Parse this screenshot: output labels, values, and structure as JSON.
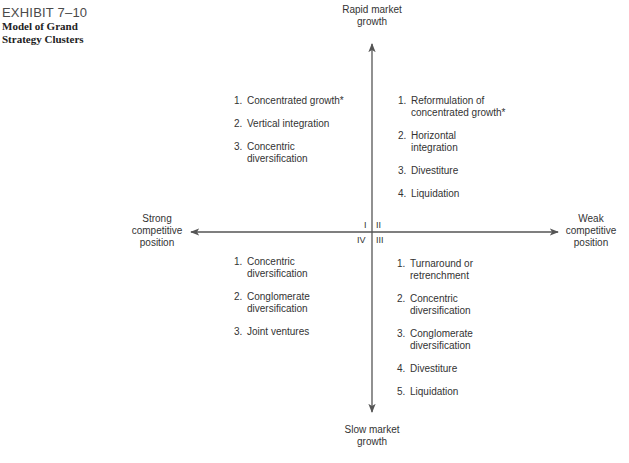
{
  "exhibit": {
    "number": "EXHIBIT 7–10",
    "title_line1": "Model of Grand",
    "title_line2": "Strategy Clusters"
  },
  "axes": {
    "top_label_line1": "Rapid market",
    "top_label_line2": "growth",
    "bottom_label_line1": "Slow market",
    "bottom_label_line2": "growth",
    "left_label_line1": "Strong",
    "left_label_line2": "competitive",
    "left_label_line3": "position",
    "right_label_line1": "Weak",
    "right_label_line2": "competitive",
    "right_label_line3": "position",
    "line_color": "#555555"
  },
  "quadrants": {
    "I": {
      "label": "I",
      "items": [
        {
          "num": "1.",
          "line1": "Concentrated growth*",
          "line2": ""
        },
        {
          "num": "2.",
          "line1": "Vertical integration",
          "line2": ""
        },
        {
          "num": "3.",
          "line1": "Concentric",
          "line2": "diversification"
        }
      ]
    },
    "II": {
      "label": "II",
      "items": [
        {
          "num": "1.",
          "line1": "Reformulation of",
          "line2": "concentrated growth*"
        },
        {
          "num": "2.",
          "line1": "Horizontal",
          "line2": "integration"
        },
        {
          "num": "3.",
          "line1": "Divestiture",
          "line2": ""
        },
        {
          "num": "4.",
          "line1": "Liquidation",
          "line2": ""
        }
      ]
    },
    "III": {
      "label": "III",
      "items": [
        {
          "num": "1.",
          "line1": "Turnaround or",
          "line2": "retrenchment"
        },
        {
          "num": "2.",
          "line1": "Concentric",
          "line2": "diversification"
        },
        {
          "num": "3.",
          "line1": "Conglomerate",
          "line2": "diversification"
        },
        {
          "num": "4.",
          "line1": "Divestiture",
          "line2": ""
        },
        {
          "num": "5.",
          "line1": "Liquidation",
          "line2": ""
        }
      ]
    },
    "IV": {
      "label": "IV",
      "items": [
        {
          "num": "1.",
          "line1": "Concentric",
          "line2": "diversification"
        },
        {
          "num": "2.",
          "line1": "Conglomerate",
          "line2": "diversification"
        },
        {
          "num": "3.",
          "line1": "Joint ventures",
          "line2": ""
        }
      ]
    }
  }
}
